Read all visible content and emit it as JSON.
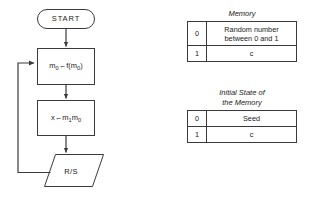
{
  "flowchart": {
    "start_label": "START",
    "process_1": {
      "lhs": "m",
      "lhs_sub": "0",
      "arrow": "←",
      "rhs_prefix": "f(m",
      "rhs_sub": "0",
      "rhs_suffix": ")"
    },
    "process_2": {
      "lhs": "x",
      "arrow": "←",
      "rhs_1": "m",
      "rhs_1_sub": "1",
      "rhs_2": "m",
      "rhs_2_sub": "0"
    },
    "io_label": "R/S"
  },
  "memory_table": {
    "caption": "Memory",
    "rows": [
      {
        "index": "0",
        "value": "Random number\nbetween 0 and 1"
      },
      {
        "index": "1",
        "value": "c"
      }
    ],
    "row_0_line_1": "Random number",
    "row_0_line_2": "between 0 and 1",
    "row_1_value": "c",
    "row_0_index": "0",
    "row_1_index": "1"
  },
  "initial_state_table": {
    "caption_line_1": "Initial State of",
    "caption_line_2": "the Memory",
    "rows": [
      {
        "index": "0",
        "value": "Seed"
      },
      {
        "index": "1",
        "value": "c"
      }
    ],
    "row_0_index": "0",
    "row_0_value": "Seed",
    "row_1_index": "1",
    "row_1_value": "c"
  },
  "style": {
    "stroke_color": "#3a3a3a",
    "text_color": "#1a1a1a",
    "background": "#ffffff"
  }
}
